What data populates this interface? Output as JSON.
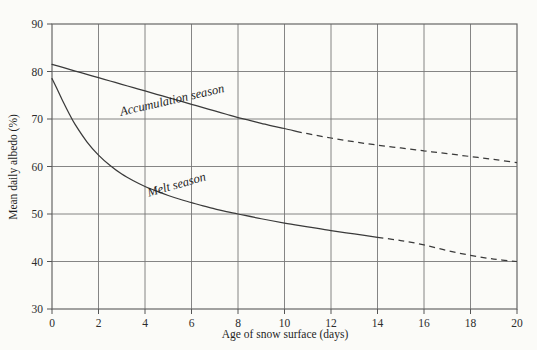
{
  "chart_data": {
    "type": "line",
    "title": "",
    "xlabel": "Age of snow surface (days)",
    "ylabel": "Mean daily albedo (%)",
    "xlim": [
      0,
      20
    ],
    "ylim": [
      30,
      90
    ],
    "xticks": [
      0,
      2,
      4,
      6,
      8,
      10,
      12,
      14,
      16,
      18,
      20
    ],
    "yticks": [
      30,
      40,
      50,
      60,
      70,
      80,
      90
    ],
    "xtick_labels": [
      "0",
      "2",
      "4",
      "6",
      "8",
      "10",
      "12",
      "14",
      "16",
      "18",
      "20"
    ],
    "ytick_labels": [
      "30",
      "40",
      "50",
      "60",
      "70",
      "80",
      "90"
    ],
    "grid": true,
    "legend_position": "inline-annotation",
    "annotations": [
      {
        "text": "Accumulation season",
        "x": 5.2,
        "y": 73.2,
        "rotation": -13
      },
      {
        "text": "Melt season",
        "x": 5.4,
        "y": 55.4,
        "rotation": -16
      }
    ],
    "series": [
      {
        "name": "Accumulation season",
        "style": "solid-then-dashed",
        "solid_to_x": 10.5,
        "x": [
          0,
          0.5,
          1,
          1.5,
          2,
          2.5,
          3,
          3.5,
          4,
          4.5,
          5,
          5.5,
          6,
          6.5,
          7,
          7.5,
          8,
          8.5,
          9,
          9.5,
          10,
          10.5,
          11,
          12,
          13,
          14,
          15,
          16,
          17,
          18,
          19,
          20
        ],
        "values": [
          81.5,
          80.8,
          80.1,
          79.4,
          78.7,
          78.0,
          77.3,
          76.6,
          75.9,
          75.2,
          74.5,
          73.8,
          73.1,
          72.4,
          71.7,
          71.0,
          70.3,
          69.7,
          69.1,
          68.5,
          68.0,
          67.4,
          66.9,
          66.0,
          65.2,
          64.5,
          63.9,
          63.3,
          62.7,
          62.1,
          61.5,
          60.8
        ],
        "y_at_x0": 81.5,
        "y_at_x20": 60.8
      },
      {
        "name": "Melt season",
        "style": "solid-then-dashed",
        "solid_to_x": 14.0,
        "x": [
          0,
          0.25,
          0.5,
          0.75,
          1,
          1.5,
          2,
          2.5,
          3,
          3.5,
          4,
          4.5,
          5,
          5.5,
          6,
          6.5,
          7,
          7.5,
          8,
          9,
          10,
          11,
          12,
          13,
          14,
          15,
          16,
          17,
          18,
          19,
          20
        ],
        "values": [
          78.5,
          76.0,
          73.4,
          71.0,
          68.8,
          65.2,
          62.4,
          60.2,
          58.4,
          57.0,
          55.8,
          54.8,
          53.9,
          53.1,
          52.4,
          51.7,
          51.1,
          50.5,
          50.0,
          49.0,
          48.1,
          47.3,
          46.5,
          45.8,
          45.1,
          44.4,
          43.5,
          42.3,
          41.3,
          40.5,
          40.0
        ],
        "y_at_x0": 78.5,
        "y_at_x20": 40.0
      }
    ]
  },
  "colors": {
    "background": "#fbfbf8",
    "curve": "#3a3a3a",
    "grid": "#777777",
    "frame": "#666666",
    "text": "#1f1f1f"
  }
}
